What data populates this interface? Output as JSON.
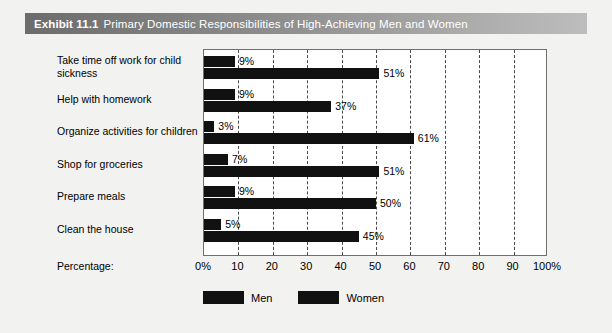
{
  "exhibit": {
    "number": "Exhibit 11.1",
    "title": "Primary Domestic Responsibilities of High-Achieving Men and Women"
  },
  "axis": {
    "percentage_label": "Percentage:",
    "ticks": [
      "0%",
      "10",
      "20",
      "30",
      "40",
      "50",
      "60",
      "70",
      "80",
      "90",
      "100%"
    ]
  },
  "legend": {
    "items": [
      {
        "label": "Men",
        "color": "#111111"
      },
      {
        "label": "Women",
        "color": "#111111"
      }
    ]
  },
  "chart_data": {
    "type": "bar",
    "orientation": "horizontal",
    "title": "Primary Domestic Responsibilities of High-Achieving Men and Women",
    "xlabel": "Percentage:",
    "ylabel": "",
    "xlim": [
      0,
      100
    ],
    "grid": true,
    "legend_position": "bottom-left",
    "categories": [
      "Take time off work for child sickness",
      "Help with homework",
      "Organize activities for children",
      "Shop for groceries",
      "Prepare meals",
      "Clean the house"
    ],
    "series": [
      {
        "name": "Men",
        "values": [
          9,
          9,
          3,
          7,
          9,
          5
        ],
        "labels": [
          "9%",
          "9%",
          "3%",
          "7%",
          "9%",
          "5%"
        ]
      },
      {
        "name": "Women",
        "values": [
          51,
          37,
          61,
          51,
          50,
          45
        ],
        "labels": [
          "51%",
          "37%",
          "61%",
          "51%",
          "50%",
          "45%"
        ]
      }
    ],
    "tick_labels": [
      "0%",
      "10",
      "20",
      "30",
      "40",
      "50",
      "60",
      "70",
      "80",
      "90",
      "100%"
    ]
  }
}
